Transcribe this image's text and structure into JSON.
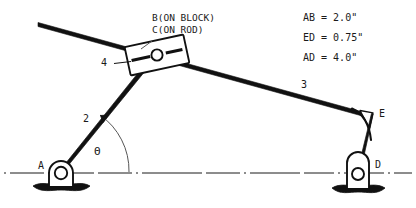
{
  "figure": {
    "stroke_color": "#111111",
    "background_color": "#ffffff"
  },
  "callout": {
    "line1": "B(ON BLOCK)",
    "line2": "C(ON ROD)"
  },
  "dimensions": [
    {
      "id": "ab",
      "text": "AB = 2.0\""
    },
    {
      "id": "ed",
      "text": "ED = 0.75\""
    },
    {
      "id": "ad",
      "text": "AD = 4.0\""
    }
  ],
  "point_labels": [
    {
      "id": "a",
      "text": "A"
    },
    {
      "id": "d",
      "text": "D"
    },
    {
      "id": "e",
      "text": "E"
    }
  ],
  "link_labels": [
    {
      "id": "link2",
      "text": "2"
    },
    {
      "id": "link3",
      "text": "3"
    },
    {
      "id": "link4",
      "text": "4"
    }
  ],
  "angle": {
    "symbol": "Θ",
    "name": "theta"
  },
  "geometry": {
    "pivot_a": {
      "x": 61,
      "y": 173
    },
    "pivot_d": {
      "x": 358,
      "y": 174
    },
    "block_pin": {
      "x": 157,
      "y": 55
    },
    "joint_e": {
      "x": 372,
      "y": 113
    },
    "rod_left_end": {
      "x": 38,
      "y": 22
    },
    "ground_line_y": 173
  }
}
